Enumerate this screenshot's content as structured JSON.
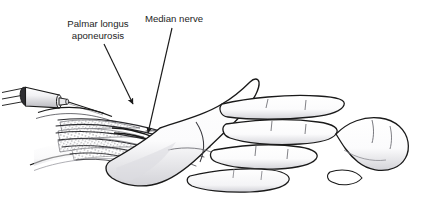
{
  "figure": {
    "type": "medical-line-illustration",
    "width": 435,
    "height": 212,
    "background_color": "#ffffff",
    "ink_color": "#1a1a1a",
    "shade_color": "#b8b8bd",
    "light_shade_color": "#e2e2e6"
  },
  "labels": [
    {
      "id": "palmar-longus-aponeurosis",
      "line1": "Palmar longus",
      "line2": "aponeurosis",
      "text_anchor": "middle",
      "x": 98,
      "y1": 27,
      "y2": 39,
      "leader": {
        "from_x": 104,
        "from_y": 44,
        "to_x": 133,
        "to_y": 104,
        "arrowhead": true
      }
    },
    {
      "id": "median-nerve",
      "line1": "Median nerve",
      "line2": "",
      "text_anchor": "middle",
      "x": 174,
      "y1": 22,
      "y2": 0,
      "leader": {
        "from_x": 172,
        "from_y": 28,
        "to_x": 148,
        "to_y": 133,
        "arrowhead": true
      }
    }
  ],
  "parts": [
    {
      "id": "syringe-barrel",
      "name": "syringe barrel"
    },
    {
      "id": "syringe-plunger",
      "name": "syringe plunger"
    },
    {
      "id": "syringe-needle",
      "name": "injection needle"
    },
    {
      "id": "forearm-wrist",
      "name": "distal forearm and wrist"
    },
    {
      "id": "palmar-aponeurosis-fan",
      "name": "palmar aponeurosis fibrous fan"
    },
    {
      "id": "flexor-tendons",
      "name": "flexor tendon bundle"
    },
    {
      "id": "median-nerve-bundle",
      "name": "median nerve"
    },
    {
      "id": "palm",
      "name": "palm of hand"
    },
    {
      "id": "index-finger",
      "name": "index finger"
    },
    {
      "id": "middle-finger",
      "name": "middle finger"
    },
    {
      "id": "ring-finger",
      "name": "ring finger"
    },
    {
      "id": "little-finger",
      "name": "little finger"
    },
    {
      "id": "thumb",
      "name": "thumb"
    }
  ]
}
